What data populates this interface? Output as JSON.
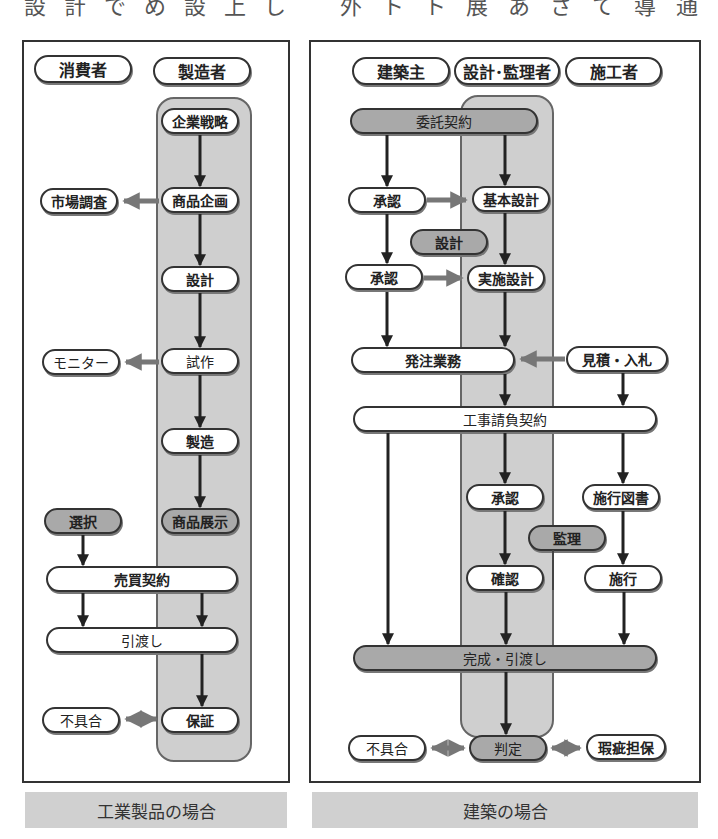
{
  "top_text": {
    "left": [
      "設",
      "計",
      "で",
      "め",
      "設",
      "上",
      "し"
    ],
    "right": [
      "外",
      "ト",
      "ト",
      "展",
      "あ",
      "さ",
      "て",
      "導",
      "通"
    ]
  },
  "left_diagram": {
    "caption": "工業製品の場合",
    "headers": {
      "consumer": "消費者",
      "manufacturer": "製造者"
    },
    "nodes": {
      "corporate_strategy": "企業戦略",
      "product_planning": "商品企画",
      "market_research": "市場調査",
      "design": "設計",
      "prototype": "試作",
      "monitor": "モニター",
      "manufacturing": "製造",
      "product_display": "商品展示",
      "selection": "選択",
      "sales_contract": "売買契約",
      "delivery": "引渡し",
      "defect": "不具合",
      "warranty": "保証"
    }
  },
  "right_diagram": {
    "caption": "建築の場合",
    "headers": {
      "owner": "建築主",
      "designer_supervisor": "設計･監理者",
      "contractor": "施工者"
    },
    "nodes": {
      "commission_contract": "委託契約",
      "approval_1": "承認",
      "basic_design": "基本設計",
      "design_phase": "設計",
      "approval_2": "承認",
      "detailed_design": "実施設計",
      "ordering": "発注業務",
      "estimate_bid": "見積・入札",
      "construction_contract": "工事請負契約",
      "approval_3": "承認",
      "construction_drawings": "施行図書",
      "supervision": "監理",
      "confirmation": "確認",
      "construction": "施行",
      "completion_delivery": "完成・引渡し",
      "defect": "不具合",
      "judgment": "判定",
      "defect_warranty": "瑕疵担保"
    }
  },
  "colors": {
    "lane_fill": "#cfcfcf",
    "gray_node": "#a9a9a9",
    "caption_bg": "#d0d0d0",
    "arrow_dark": "#222222",
    "arrow_gray": "#777777"
  }
}
